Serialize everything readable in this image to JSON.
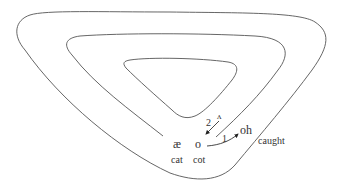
{
  "diagram": {
    "type": "vowel-space-spiral",
    "vowels": [
      {
        "symbol": "æ",
        "word": "cat"
      },
      {
        "symbol": "o",
        "word": "cot"
      },
      {
        "symbol": "oh",
        "word": "caught"
      },
      {
        "symbol": "ʌ",
        "word": ""
      }
    ],
    "arrows": [
      {
        "label": "1",
        "from": "o",
        "to": "oh"
      },
      {
        "label": "2",
        "from": "ʌ",
        "to": "o"
      }
    ],
    "colors": {
      "line": "#555555",
      "text": "#333333",
      "background": "#ffffff"
    }
  },
  "labels": {
    "ae": "æ",
    "o": "o",
    "oh": "oh",
    "wedge": "ʌ",
    "cat": "cat",
    "cot": "cot",
    "caught": "caught",
    "arrow1": "1",
    "arrow2": "2"
  }
}
